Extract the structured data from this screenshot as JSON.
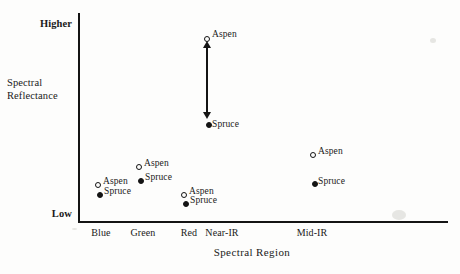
{
  "chart_data": {
    "type": "scatter",
    "title": "",
    "xlabel": "Spectral Region",
    "ylabel": "Spectral Reflectance",
    "categories": [
      "Blue",
      "Green",
      "Red",
      "Near-IR",
      "Mid-IR"
    ],
    "ytick_labels": [
      "Low",
      "Higher"
    ],
    "ylim_labels": {
      "bottom": "Low",
      "top": "Higher"
    },
    "grid": false,
    "legend": false,
    "annotations": [
      {
        "name": "near-ir-separation-arrow",
        "type": "double-headed-arrow",
        "category": "Near-IR",
        "from_series": "Spruce",
        "to_series": "Aspen",
        "meaning": "largest reflectance separation between Aspen and Spruce"
      }
    ],
    "series": [
      {
        "name": "Aspen",
        "marker": "open-circle",
        "values": [
          0.23,
          0.32,
          0.18,
          0.94,
          0.39
        ],
        "point_labels": [
          "Aspen",
          "Aspen",
          "Aspen",
          "Aspen",
          "Aspen"
        ]
      },
      {
        "name": "Spruce",
        "marker": "filled-circle",
        "values": [
          0.18,
          0.25,
          0.14,
          0.53,
          0.25
        ],
        "point_labels": [
          "Spruce",
          "Spruce",
          "Spruce",
          "Spruce",
          "Spruce"
        ]
      }
    ],
    "points": [
      {
        "category": "Blue",
        "series": "Aspen",
        "label": "Aspen",
        "marker": "open-circle",
        "x": 95,
        "y": 182,
        "label_x": 103,
        "label_y": 176
      },
      {
        "category": "Blue",
        "series": "Spruce",
        "label": "Spruce",
        "marker": "filled-circle",
        "x": 97,
        "y": 192,
        "label_x": 104,
        "label_y": 186
      },
      {
        "category": "Green",
        "series": "Aspen",
        "label": "Aspen",
        "marker": "open-circle",
        "x": 136,
        "y": 164,
        "label_x": 144,
        "label_y": 158
      },
      {
        "category": "Green",
        "series": "Spruce",
        "label": "Spruce",
        "marker": "filled-circle",
        "x": 138,
        "y": 178,
        "label_x": 145,
        "label_y": 172
      },
      {
        "category": "Red",
        "series": "Aspen",
        "label": "Aspen",
        "marker": "open-circle",
        "x": 181,
        "y": 192,
        "label_x": 189,
        "label_y": 186
      },
      {
        "category": "Red",
        "series": "Spruce",
        "label": "Spruce",
        "marker": "filled-circle",
        "x": 183,
        "y": 201,
        "label_x": 190,
        "label_y": 195
      },
      {
        "category": "Near-IR",
        "series": "Aspen",
        "label": "Aspen",
        "marker": "open-circle",
        "x": 204,
        "y": 36,
        "label_x": 212,
        "label_y": 29
      },
      {
        "category": "Near-IR",
        "series": "Spruce",
        "label": "Spruce",
        "marker": "filled-circle",
        "x": 206,
        "y": 122,
        "label_x": 212,
        "label_y": 119
      },
      {
        "category": "Mid-IR",
        "series": "Aspen",
        "label": "Aspen",
        "marker": "open-circle",
        "x": 310,
        "y": 152,
        "label_x": 318,
        "label_y": 146
      },
      {
        "category": "Mid-IR",
        "series": "Spruce",
        "label": "Spruce",
        "marker": "filled-circle",
        "x": 312,
        "y": 181,
        "label_x": 318,
        "label_y": 176
      }
    ],
    "xtick_positions": [
      {
        "label": "Blue",
        "x": 101
      },
      {
        "label": "Green",
        "x": 143
      },
      {
        "label": "Red",
        "x": 189
      },
      {
        "label": "Near-IR",
        "x": 222
      },
      {
        "label": "Mid-IR",
        "x": 312
      }
    ]
  },
  "axis": {
    "y_title_line1": "Spectral",
    "y_title_line2": "Reflectance",
    "y_top": "Higher",
    "y_bottom": "Low",
    "x_title": "Spectral Region"
  }
}
